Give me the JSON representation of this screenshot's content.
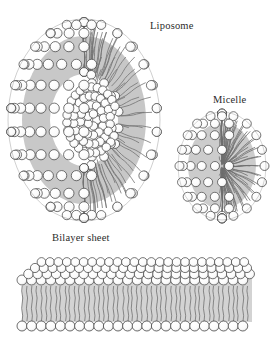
{
  "figure": {
    "title_visible": false,
    "background_color": "#ffffff",
    "ink_color": "#2b2b2b",
    "head_fill": "#ffffff",
    "tail_color": "#8a8a8a",
    "tail_color_dark": "#5a5a5a"
  },
  "labels": {
    "liposome": "Liposome",
    "micelle": "Micelle",
    "bilayer": "Bilayer sheet"
  },
  "structures": [
    {
      "name": "liposome",
      "label": "Liposome",
      "description": "cutaway spherical vesicle with lipid bilayer shell and aqueous core",
      "center_x": 84,
      "center_y": 120,
      "radius_x": 76,
      "radius_y": 101
    },
    {
      "name": "micelle",
      "label": "Micelle",
      "description": "cutaway spherical monolayer aggregate with tails converging at center",
      "center_x": 222,
      "center_y": 166,
      "radius_x": 44,
      "radius_y": 54
    },
    {
      "name": "bilayer-sheet",
      "label": "Bilayer sheet",
      "description": "planar lipid bilayer slab drawn in perspective, heads on both faces",
      "left": 18,
      "top": 250,
      "width": 238,
      "height": 90
    }
  ]
}
